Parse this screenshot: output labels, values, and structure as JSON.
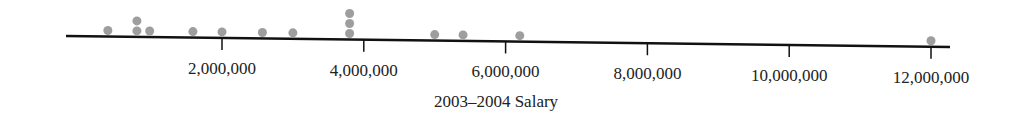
{
  "chart_data": {
    "type": "scatter",
    "subtype": "dot plot",
    "title": "",
    "xlabel": "2003–2004 Salary",
    "ylabel": "",
    "xlim": [
      -500000,
      12300000
    ],
    "xticks": [
      2000000,
      4000000,
      6000000,
      8000000,
      10000000,
      12000000
    ],
    "xtick_labels": [
      "2,000,000",
      "4,000,000",
      "6,000,000",
      "8,000,000",
      "10,000,000",
      "12,000,000"
    ],
    "grid": false,
    "legend": null,
    "dot_color": "#9e9e9e",
    "points": [
      {
        "x": 390000,
        "count": 1
      },
      {
        "x": 800000,
        "count": 2
      },
      {
        "x": 980000,
        "count": 1
      },
      {
        "x": 1590000,
        "count": 1
      },
      {
        "x": 2000000,
        "count": 1
      },
      {
        "x": 2570000,
        "count": 1
      },
      {
        "x": 3000000,
        "count": 1
      },
      {
        "x": 3800000,
        "count": 3
      },
      {
        "x": 5000000,
        "count": 1
      },
      {
        "x": 5400000,
        "count": 1
      },
      {
        "x": 6200000,
        "count": 1
      },
      {
        "x": 12000000,
        "count": 1
      }
    ]
  }
}
